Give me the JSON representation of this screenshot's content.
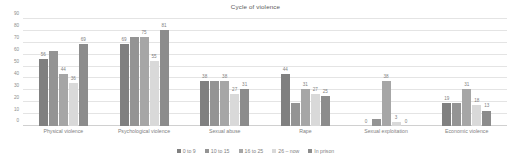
{
  "chart_data": {
    "type": "bar",
    "title": "Cycle of violence",
    "xlabel": "",
    "ylabel": "",
    "ylim": [
      0,
      90
    ],
    "yticks": [
      0,
      10,
      20,
      30,
      40,
      50,
      60,
      70,
      80,
      90
    ],
    "grid": true,
    "legend_position": "bottom",
    "categories": [
      "Physical violence",
      "Psychological violence",
      "Sexual abuse",
      "Rape",
      "Sexual exploitation",
      "Economic violence"
    ],
    "series": [
      {
        "name": "0 to 9",
        "color": "#808080",
        "values": [
          56,
          69,
          38,
          44,
          0,
          19
        ],
        "labels": [
          "56",
          "69",
          "38",
          "44",
          "0",
          "19"
        ]
      },
      {
        "name": "10 to 15",
        "color": "#949494",
        "values": [
          63,
          75,
          38,
          19,
          6,
          19
        ],
        "labels": [
          "",
          "",
          "",
          "",
          "",
          ""
        ]
      },
      {
        "name": "16 to 25",
        "color": "#a6a6a6",
        "values": [
          44,
          75,
          38,
          31,
          38,
          31
        ],
        "labels": [
          "44",
          "75",
          "38",
          "31",
          "38",
          "31"
        ]
      },
      {
        "name": "26 – now",
        "color": "#d9d9d9",
        "values": [
          36,
          55,
          27,
          27,
          3,
          18
        ],
        "labels": [
          "36",
          "55",
          "27",
          "27",
          "3",
          "18"
        ]
      },
      {
        "name": "In prison",
        "color": "#8c8c8c",
        "values": [
          69,
          81,
          31,
          25,
          0,
          13
        ],
        "labels": [
          "69",
          "81",
          "31",
          "25",
          "0",
          "13"
        ]
      }
    ]
  },
  "colors": {
    "gridline": "#e4e4e4",
    "axis": "#d0d0d0",
    "text": "#7f7f7f",
    "title": "#595959",
    "background": "#ffffff"
  }
}
